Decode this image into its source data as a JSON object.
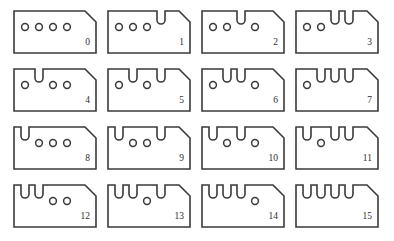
{
  "figure": {
    "title": "",
    "columns": 4,
    "rows": 4,
    "bit_count": 4,
    "bit_order": "msb-first-left-to-right",
    "encoding": {
      "hole": 0,
      "notch": 1
    },
    "colors": {
      "background": "#ffffff",
      "outline": "#3a3a3a",
      "fill": "#ffffff",
      "label": "#2e2e2e"
    },
    "geometry": {
      "card_width": 84,
      "card_height": 44,
      "col_pitch": 94,
      "row_pitch": 58,
      "origin_x": 13,
      "origin_y": 10,
      "chamfer": 11,
      "slot_pitch": 14,
      "slot_first_x": 12,
      "hole_radius": 3.4,
      "hole_center_y": 17,
      "notch_width": 8,
      "notch_depth": 14
    }
  },
  "cards": [
    {
      "label": "0",
      "value": 0,
      "bits": [
        0,
        0,
        0,
        0
      ],
      "slots": [
        "hole",
        "hole",
        "hole",
        "hole"
      ]
    },
    {
      "label": "1",
      "value": 1,
      "bits": [
        0,
        0,
        0,
        1
      ],
      "slots": [
        "hole",
        "hole",
        "hole",
        "notch"
      ]
    },
    {
      "label": "2",
      "value": 2,
      "bits": [
        0,
        0,
        1,
        0
      ],
      "slots": [
        "hole",
        "hole",
        "notch",
        "hole"
      ]
    },
    {
      "label": "3",
      "value": 3,
      "bits": [
        0,
        0,
        1,
        1
      ],
      "slots": [
        "hole",
        "hole",
        "notch",
        "notch"
      ]
    },
    {
      "label": "4",
      "value": 4,
      "bits": [
        0,
        1,
        0,
        0
      ],
      "slots": [
        "hole",
        "notch",
        "hole",
        "hole"
      ]
    },
    {
      "label": "5",
      "value": 5,
      "bits": [
        0,
        1,
        0,
        1
      ],
      "slots": [
        "hole",
        "notch",
        "hole",
        "notch"
      ]
    },
    {
      "label": "6",
      "value": 6,
      "bits": [
        0,
        1,
        1,
        0
      ],
      "slots": [
        "hole",
        "notch",
        "notch",
        "hole"
      ]
    },
    {
      "label": "7",
      "value": 7,
      "bits": [
        0,
        1,
        1,
        1
      ],
      "slots": [
        "hole",
        "notch",
        "notch",
        "notch"
      ]
    },
    {
      "label": "8",
      "value": 8,
      "bits": [
        1,
        0,
        0,
        0
      ],
      "slots": [
        "notch",
        "hole",
        "hole",
        "hole"
      ]
    },
    {
      "label": "9",
      "value": 9,
      "bits": [
        1,
        0,
        0,
        1
      ],
      "slots": [
        "notch",
        "hole",
        "hole",
        "notch"
      ]
    },
    {
      "label": "10",
      "value": 10,
      "bits": [
        1,
        0,
        1,
        0
      ],
      "slots": [
        "notch",
        "hole",
        "notch",
        "hole"
      ]
    },
    {
      "label": "11",
      "value": 11,
      "bits": [
        1,
        0,
        1,
        1
      ],
      "slots": [
        "notch",
        "hole",
        "notch",
        "notch"
      ]
    },
    {
      "label": "12",
      "value": 12,
      "bits": [
        1,
        1,
        0,
        0
      ],
      "slots": [
        "notch",
        "notch",
        "hole",
        "hole"
      ]
    },
    {
      "label": "13",
      "value": 13,
      "bits": [
        1,
        1,
        0,
        1
      ],
      "slots": [
        "notch",
        "notch",
        "hole",
        "notch"
      ]
    },
    {
      "label": "14",
      "value": 14,
      "bits": [
        1,
        1,
        1,
        0
      ],
      "slots": [
        "notch",
        "notch",
        "notch",
        "hole"
      ]
    },
    {
      "label": "15",
      "value": 15,
      "bits": [
        1,
        1,
        1,
        1
      ],
      "slots": [
        "notch",
        "notch",
        "notch",
        "notch"
      ]
    }
  ]
}
